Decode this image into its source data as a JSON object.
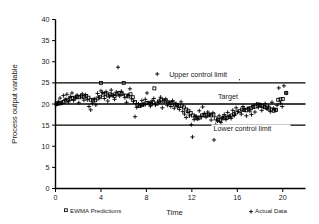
{
  "chart_data": {
    "type": "scatter",
    "title": "",
    "xlabel": "Time",
    "ylabel": "Process output variable",
    "xlim": [
      0,
      22
    ],
    "ylim": [
      0,
      40
    ],
    "xticks": [
      0,
      4,
      8,
      12,
      16,
      20
    ],
    "yticks": [
      0,
      5,
      10,
      15,
      20,
      25,
      30,
      35,
      40
    ],
    "grid": false,
    "legend_position": "below-axes",
    "reference_lines": [
      {
        "name": "upper-control-limit",
        "label": "Upper control limit",
        "value": 25,
        "label_x": 10.0,
        "label_y": 26.4
      },
      {
        "name": "target",
        "label": "Target",
        "value": 20,
        "label_x": 14.3,
        "label_y": 21.3
      },
      {
        "name": "lower-control-limit",
        "label": "Lower control limit",
        "value": 15,
        "label_x": 13.9,
        "label_y": 13.7
      }
    ],
    "series": [
      {
        "name": "Actual Data",
        "marker": "plus",
        "points": [
          [
            0.1,
            19.9
          ],
          [
            0.25,
            20.6
          ],
          [
            0.4,
            21.4
          ],
          [
            0.55,
            20.2
          ],
          [
            0.7,
            22.0
          ],
          [
            0.85,
            21.1
          ],
          [
            1.0,
            22.3
          ],
          [
            1.15,
            20.5
          ],
          [
            1.3,
            21.8
          ],
          [
            1.45,
            22.6
          ],
          [
            1.6,
            20.8
          ],
          [
            1.75,
            21.5
          ],
          [
            1.9,
            22.1
          ],
          [
            2.05,
            20.3
          ],
          [
            2.2,
            21.9
          ],
          [
            2.35,
            22.4
          ],
          [
            2.5,
            20.9
          ],
          [
            2.65,
            22.2
          ],
          [
            2.8,
            21.0
          ],
          [
            2.95,
            19.4
          ],
          [
            3.1,
            18.6
          ],
          [
            3.25,
            20.1
          ],
          [
            3.4,
            21.2
          ],
          [
            3.55,
            19.8
          ],
          [
            3.7,
            22.5
          ],
          [
            3.85,
            21.6
          ],
          [
            4.0,
            23.1
          ],
          [
            4.15,
            22.7
          ],
          [
            4.3,
            21.3
          ],
          [
            4.45,
            22.9
          ],
          [
            4.6,
            20.7
          ],
          [
            4.75,
            21.7
          ],
          [
            4.9,
            23.3
          ],
          [
            5.05,
            22.0
          ],
          [
            5.2,
            21.1
          ],
          [
            5.35,
            22.8
          ],
          [
            5.5,
            28.7
          ],
          [
            5.65,
            21.9
          ],
          [
            5.8,
            23.0
          ],
          [
            5.95,
            22.3
          ],
          [
            6.1,
            21.5
          ],
          [
            6.25,
            20.4
          ],
          [
            6.4,
            22.1
          ],
          [
            6.55,
            23.6
          ],
          [
            6.7,
            21.2
          ],
          [
            6.85,
            20.6
          ],
          [
            7.0,
            17.0
          ],
          [
            7.15,
            19.2
          ],
          [
            7.3,
            20.0
          ],
          [
            7.45,
            19.6
          ],
          [
            7.6,
            20.8
          ],
          [
            7.75,
            19.9
          ],
          [
            7.9,
            21.1
          ],
          [
            8.05,
            22.6
          ],
          [
            8.2,
            20.2
          ],
          [
            8.35,
            19.5
          ],
          [
            8.5,
            20.7
          ],
          [
            8.65,
            21.3
          ],
          [
            8.8,
            19.8
          ],
          [
            8.95,
            27.1
          ],
          [
            9.1,
            20.5
          ],
          [
            9.25,
            21.6
          ],
          [
            9.4,
            19.1
          ],
          [
            9.55,
            20.9
          ],
          [
            9.7,
            21.2
          ],
          [
            9.85,
            19.7
          ],
          [
            10.0,
            20.3
          ],
          [
            10.15,
            19.4
          ],
          [
            10.3,
            20.8
          ],
          [
            10.45,
            19.0
          ],
          [
            10.6,
            20.1
          ],
          [
            10.75,
            19.3
          ],
          [
            10.9,
            18.7
          ],
          [
            11.05,
            20.5
          ],
          [
            11.2,
            18.2
          ],
          [
            11.35,
            17.6
          ],
          [
            11.5,
            16.8
          ],
          [
            11.65,
            18.0
          ],
          [
            11.8,
            17.2
          ],
          [
            11.95,
            15.1
          ],
          [
            12.05,
            12.2
          ],
          [
            12.2,
            16.3
          ],
          [
            12.35,
            17.1
          ],
          [
            12.5,
            16.5
          ],
          [
            12.65,
            18.4
          ],
          [
            12.8,
            17.0
          ],
          [
            12.95,
            19.3
          ],
          [
            13.1,
            17.8
          ],
          [
            13.25,
            16.9
          ],
          [
            13.4,
            18.1
          ],
          [
            13.55,
            17.4
          ],
          [
            13.7,
            16.2
          ],
          [
            13.85,
            17.9
          ],
          [
            13.95,
            11.5
          ],
          [
            14.1,
            15.1
          ],
          [
            14.25,
            16.0
          ],
          [
            14.4,
            17.2
          ],
          [
            14.55,
            15.6
          ],
          [
            14.7,
            16.8
          ],
          [
            14.85,
            17.5
          ],
          [
            15.0,
            16.3
          ],
          [
            15.15,
            18.0
          ],
          [
            15.3,
            17.1
          ],
          [
            15.45,
            16.6
          ],
          [
            15.6,
            18.5
          ],
          [
            15.75,
            17.3
          ],
          [
            15.9,
            19.1
          ],
          [
            16.05,
            18.2
          ],
          [
            16.2,
            26.1
          ],
          [
            16.35,
            17.6
          ],
          [
            16.5,
            19.4
          ],
          [
            16.65,
            18.8
          ],
          [
            16.8,
            17.2
          ],
          [
            16.95,
            19.0
          ],
          [
            17.1,
            18.3
          ],
          [
            17.25,
            17.5
          ],
          [
            17.4,
            19.6
          ],
          [
            17.55,
            18.1
          ],
          [
            17.7,
            20.0
          ],
          [
            17.85,
            19.2
          ],
          [
            18.0,
            19.8
          ],
          [
            18.15,
            18.5
          ],
          [
            18.3,
            19.3
          ],
          [
            18.45,
            20.1
          ],
          [
            18.6,
            18.9
          ],
          [
            18.75,
            19.5
          ],
          [
            18.9,
            18.2
          ],
          [
            19.05,
            20.4
          ],
          [
            19.2,
            19.0
          ],
          [
            19.35,
            18.6
          ],
          [
            19.5,
            19.7
          ],
          [
            19.65,
            23.8
          ],
          [
            19.8,
            20.2
          ],
          [
            19.95,
            19.4
          ],
          [
            20.1,
            24.3
          ],
          [
            20.3,
            22.6
          ]
        ]
      },
      {
        "name": "EWMA Predictions",
        "marker": "square",
        "points": [
          [
            0.1,
            20.0
          ],
          [
            0.3,
            20.1
          ],
          [
            0.5,
            20.3
          ],
          [
            0.7,
            20.5
          ],
          [
            0.9,
            20.8
          ],
          [
            1.1,
            21.0
          ],
          [
            1.3,
            21.2
          ],
          [
            1.5,
            21.4
          ],
          [
            1.7,
            21.5
          ],
          [
            1.9,
            21.7
          ],
          [
            2.1,
            21.6
          ],
          [
            2.3,
            21.8
          ],
          [
            2.5,
            21.7
          ],
          [
            2.7,
            21.9
          ],
          [
            2.9,
            21.5
          ],
          [
            3.1,
            21.0
          ],
          [
            3.3,
            20.8
          ],
          [
            3.5,
            20.9
          ],
          [
            3.7,
            21.3
          ],
          [
            3.9,
            21.6
          ],
          [
            4.0,
            25.0
          ],
          [
            4.2,
            22.2
          ],
          [
            4.4,
            22.4
          ],
          [
            4.6,
            22.0
          ],
          [
            4.8,
            22.3
          ],
          [
            5.0,
            22.2
          ],
          [
            5.2,
            21.9
          ],
          [
            5.4,
            22.3
          ],
          [
            5.6,
            22.6
          ],
          [
            5.8,
            22.4
          ],
          [
            6.0,
            25.0
          ],
          [
            6.2,
            22.0
          ],
          [
            6.4,
            21.8
          ],
          [
            6.6,
            22.3
          ],
          [
            6.8,
            21.6
          ],
          [
            7.0,
            20.5
          ],
          [
            7.2,
            19.8
          ],
          [
            7.4,
            19.5
          ],
          [
            7.6,
            19.8
          ],
          [
            7.8,
            19.9
          ],
          [
            8.0,
            20.2
          ],
          [
            8.2,
            20.3
          ],
          [
            8.4,
            20.0
          ],
          [
            8.6,
            20.4
          ],
          [
            8.7,
            23.7
          ],
          [
            8.9,
            20.1
          ],
          [
            9.1,
            20.6
          ],
          [
            9.3,
            21.0
          ],
          [
            9.5,
            20.6
          ],
          [
            9.7,
            20.8
          ],
          [
            9.9,
            20.4
          ],
          [
            10.1,
            20.2
          ],
          [
            10.3,
            20.3
          ],
          [
            10.5,
            19.9
          ],
          [
            10.7,
            19.8
          ],
          [
            10.9,
            19.5
          ],
          [
            11.1,
            19.6
          ],
          [
            11.3,
            19.2
          ],
          [
            11.5,
            18.7
          ],
          [
            11.7,
            18.4
          ],
          [
            11.9,
            17.9
          ],
          [
            12.1,
            17.3
          ],
          [
            12.3,
            17.0
          ],
          [
            12.5,
            16.6
          ],
          [
            12.7,
            16.8
          ],
          [
            12.9,
            17.3
          ],
          [
            13.1,
            17.4
          ],
          [
            13.3,
            17.3
          ],
          [
            13.5,
            17.5
          ],
          [
            13.7,
            17.3
          ],
          [
            13.9,
            17.5
          ],
          [
            14.1,
            16.6
          ],
          [
            14.3,
            16.3
          ],
          [
            14.5,
            16.2
          ],
          [
            14.7,
            16.6
          ],
          [
            14.9,
            16.8
          ],
          [
            15.1,
            16.8
          ],
          [
            15.3,
            17.0
          ],
          [
            15.5,
            17.3
          ],
          [
            15.7,
            17.6
          ],
          [
            15.9,
            18.0
          ],
          [
            16.0,
            22.2
          ],
          [
            16.2,
            18.3
          ],
          [
            16.4,
            18.7
          ],
          [
            16.6,
            18.6
          ],
          [
            16.8,
            18.5
          ],
          [
            17.0,
            18.9
          ],
          [
            17.2,
            19.0
          ],
          [
            17.4,
            19.3
          ],
          [
            17.6,
            19.4
          ],
          [
            17.8,
            19.9
          ],
          [
            18.0,
            19.8
          ],
          [
            18.2,
            19.5
          ],
          [
            18.4,
            19.3
          ],
          [
            18.6,
            19.1
          ],
          [
            18.8,
            18.9
          ],
          [
            19.0,
            18.7
          ],
          [
            19.2,
            18.4
          ],
          [
            19.4,
            18.6
          ],
          [
            19.6,
            21.0
          ],
          [
            19.8,
            21.1
          ],
          [
            20.0,
            21.2
          ],
          [
            20.3,
            22.6
          ]
        ]
      }
    ],
    "legend": [
      {
        "label": "EWMA Predictions",
        "marker": "square"
      },
      {
        "label": "Actual Data",
        "marker": "plus"
      }
    ]
  }
}
